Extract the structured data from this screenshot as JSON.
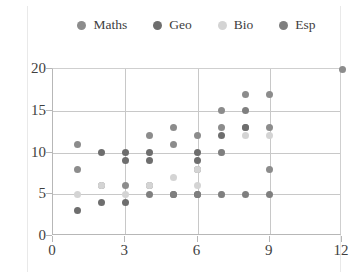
{
  "chart_data": {
    "type": "scatter",
    "title": "",
    "xlabel": "",
    "ylabel": "",
    "xlim": [
      0,
      12
    ],
    "ylim": [
      0,
      20
    ],
    "xticks": [
      0,
      3,
      6,
      9,
      12
    ],
    "yticks": [
      0,
      5,
      10,
      15,
      20
    ],
    "grid": true,
    "legend_position": "top",
    "colors": {
      "Maths": "#8c8c8c",
      "Geo": "#6e6e6e",
      "Bio": "#d4d4d4",
      "Esp": "#7f7f7f"
    },
    "series": [
      {
        "name": "Maths",
        "color": "#8c8c8c",
        "points": [
          [
            1,
            11
          ],
          [
            1,
            8
          ],
          [
            2,
            6
          ],
          [
            3,
            6
          ],
          [
            4,
            6
          ],
          [
            4,
            12
          ],
          [
            5,
            11
          ],
          [
            5,
            13
          ],
          [
            6,
            8
          ],
          [
            6,
            12
          ],
          [
            7,
            13
          ],
          [
            7,
            15
          ],
          [
            8,
            17
          ],
          [
            8,
            13
          ],
          [
            9,
            17
          ],
          [
            9,
            13
          ],
          [
            9,
            8
          ],
          [
            12,
            20
          ]
        ]
      },
      {
        "name": "Geo",
        "color": "#6e6e6e",
        "points": [
          [
            1,
            3
          ],
          [
            2,
            10
          ],
          [
            2,
            4
          ],
          [
            3,
            10
          ],
          [
            3,
            9
          ],
          [
            3,
            4
          ],
          [
            4,
            10
          ],
          [
            4,
            9
          ],
          [
            5,
            5
          ],
          [
            6,
            10
          ],
          [
            6,
            9
          ],
          [
            6,
            5
          ],
          [
            7,
            12
          ],
          [
            8,
            13
          ]
        ]
      },
      {
        "name": "Bio",
        "color": "#d4d4d4",
        "points": [
          [
            1,
            5
          ],
          [
            2,
            6
          ],
          [
            3,
            5
          ],
          [
            4,
            6
          ],
          [
            5,
            7
          ],
          [
            6,
            6
          ],
          [
            6,
            8
          ],
          [
            7,
            5
          ],
          [
            7,
            10
          ],
          [
            8,
            12
          ],
          [
            9,
            12
          ]
        ]
      },
      {
        "name": "Esp",
        "color": "#7f7f7f",
        "points": [
          [
            4,
            5
          ],
          [
            5,
            5
          ],
          [
            6,
            5
          ],
          [
            7,
            5
          ],
          [
            8,
            5
          ],
          [
            9,
            5
          ],
          [
            7,
            10
          ],
          [
            8,
            15
          ]
        ]
      }
    ]
  },
  "legend": {
    "items": [
      {
        "label": "Maths",
        "color": "#8c8c8c"
      },
      {
        "label": "Geo",
        "color": "#6e6e6e"
      },
      {
        "label": "Bio",
        "color": "#d4d4d4"
      },
      {
        "label": "Esp",
        "color": "#7f7f7f"
      }
    ]
  },
  "axes": {
    "y_tick_labels": [
      "0",
      "5",
      "10",
      "15",
      "20"
    ],
    "x_tick_labels": [
      "0",
      "3",
      "6",
      "9",
      "12"
    ]
  }
}
